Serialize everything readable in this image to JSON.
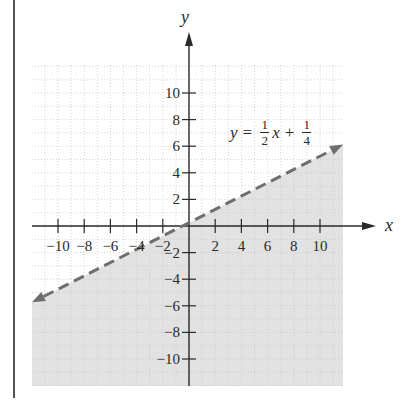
{
  "chart_data": {
    "type": "line",
    "title": "",
    "xlabel": "x",
    "ylabel": "y",
    "xlim": [
      -12,
      12
    ],
    "ylim": [
      -12,
      12
    ],
    "grid": true,
    "x_ticks": [
      -10,
      -8,
      -6,
      -4,
      -2,
      2,
      4,
      6,
      8,
      10
    ],
    "y_ticks": [
      10,
      8,
      6,
      4,
      2,
      -2,
      -4,
      -6,
      -8,
      -10
    ],
    "x_tick_labels": [
      "−10",
      "−8",
      "−6",
      "−4",
      "−2",
      "2",
      "4",
      "6",
      "8",
      "10"
    ],
    "y_tick_labels": [
      "10",
      "8",
      "6",
      "4",
      "2",
      "−2",
      "−4",
      "−6",
      "−8",
      "−10"
    ],
    "series": [
      {
        "name": "y = 1/2 x + 1/4",
        "style": "dashed",
        "slope": 0.5,
        "intercept": 0.25,
        "x": [
          -12,
          12
        ],
        "y": [
          -5.75,
          6.25
        ]
      }
    ],
    "shaded_region": "below line (y < 1/2 x + 1/4)",
    "annotations": [
      {
        "text": "y = 1/2 x + 1/4",
        "x": 4,
        "y": 7.5
      }
    ]
  },
  "labels": {
    "x_axis": "x",
    "y_axis": "y",
    "equation": {
      "lhs": "y",
      "equals": "=",
      "frac1_num": "1",
      "frac1_den": "2",
      "var": "x",
      "plus": "+",
      "frac2_num": "1",
      "frac2_den": "4"
    }
  },
  "colors": {
    "shade": "#e2e2e2",
    "grid": "#c9c9c9",
    "axis": "#2a2a2a",
    "line": "#6e6e6e",
    "border": "#1a1a1a"
  }
}
